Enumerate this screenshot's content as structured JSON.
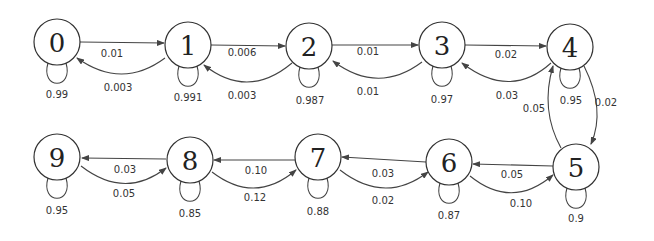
{
  "states": [
    {
      "id": "0",
      "self_loop": "0.99"
    },
    {
      "id": "1",
      "self_loop": "0.991"
    },
    {
      "id": "2",
      "self_loop": "0.987"
    },
    {
      "id": "3",
      "self_loop": "0.97"
    },
    {
      "id": "4",
      "self_loop": "0.95"
    },
    {
      "id": "5",
      "self_loop": "0.9"
    },
    {
      "id": "6",
      "self_loop": "0.87"
    },
    {
      "id": "7",
      "self_loop": "0.88"
    },
    {
      "id": "8",
      "self_loop": "0.85"
    },
    {
      "id": "9",
      "self_loop": "0.95"
    }
  ],
  "transitions": [
    {
      "from": "0",
      "to": "1",
      "p": "0.01"
    },
    {
      "from": "1",
      "to": "0",
      "p": "0.003"
    },
    {
      "from": "1",
      "to": "2",
      "p": "0.006"
    },
    {
      "from": "2",
      "to": "1",
      "p": "0.003"
    },
    {
      "from": "2",
      "to": "3",
      "p": "0.01"
    },
    {
      "from": "3",
      "to": "2",
      "p": "0.01"
    },
    {
      "from": "3",
      "to": "4",
      "p": "0.02"
    },
    {
      "from": "4",
      "to": "3",
      "p": "0.03"
    },
    {
      "from": "4",
      "to": "5",
      "p": "0.02"
    },
    {
      "from": "5",
      "to": "4",
      "p": "0.05"
    },
    {
      "from": "5",
      "to": "6",
      "p": "0.05"
    },
    {
      "from": "6",
      "to": "5",
      "p": "0.10"
    },
    {
      "from": "6",
      "to": "7",
      "p": "0.03"
    },
    {
      "from": "7",
      "to": "6",
      "p": "0.02"
    },
    {
      "from": "7",
      "to": "8",
      "p": "0.10"
    },
    {
      "from": "8",
      "to": "7",
      "p": "0.12"
    },
    {
      "from": "8",
      "to": "9",
      "p": "0.03"
    },
    {
      "from": "9",
      "to": "8",
      "p": "0.05"
    }
  ]
}
